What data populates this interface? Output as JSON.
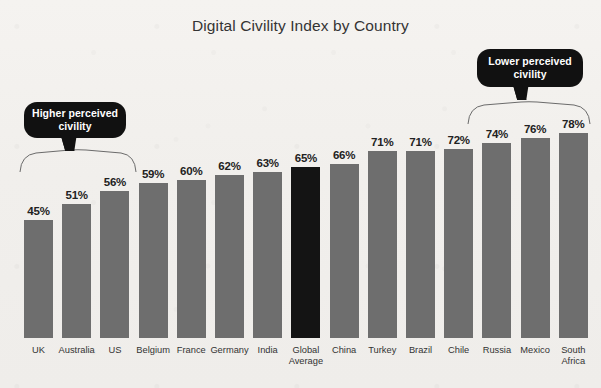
{
  "chart_data": {
    "type": "bar",
    "title": "Digital Civility Index by Country",
    "xlabel": "",
    "ylabel": "",
    "ylim": [
      0,
      80
    ],
    "grid": false,
    "legend": "none",
    "categories": [
      "UK",
      "Australia",
      "US",
      "Belgium",
      "France",
      "Germany",
      "India",
      "Global\nAverage",
      "China",
      "Turkey",
      "Brazil",
      "Chile",
      "Russia",
      "Mexico",
      "South\nAfrica"
    ],
    "values": [
      45,
      51,
      56,
      59,
      60,
      62,
      63,
      65,
      66,
      71,
      71,
      72,
      74,
      76,
      78
    ],
    "value_labels": [
      "45%",
      "51%",
      "56%",
      "59%",
      "60%",
      "62%",
      "63%",
      "65%",
      "66%",
      "71%",
      "71%",
      "72%",
      "74%",
      "76%",
      "78%"
    ],
    "bar_colors": [
      "#6e6e6e",
      "#6e6e6e",
      "#6e6e6e",
      "#6e6e6e",
      "#6e6e6e",
      "#6e6e6e",
      "#6e6e6e",
      "#141414",
      "#6e6e6e",
      "#6e6e6e",
      "#6e6e6e",
      "#6e6e6e",
      "#6e6e6e",
      "#6e6e6e",
      "#6e6e6e"
    ],
    "highlight_index": 7,
    "annotations": [
      {
        "id": "higher",
        "text": "Higher perceived civility",
        "line1": "Higher perceived",
        "line2": "civility",
        "spans_categories": [
          "UK",
          "Australia",
          "US"
        ]
      },
      {
        "id": "lower",
        "text": "Lower perceived civility",
        "line1": "Lower perceived",
        "line2": "civility",
        "spans_categories": [
          "Russia",
          "Mexico",
          "South Africa"
        ]
      }
    ]
  },
  "colors": {
    "background": "#f2f0ed",
    "bar_default": "#6e6e6e",
    "bar_highlight": "#141414",
    "callout_background": "#111111",
    "callout_text": "#ffffff",
    "title_text": "#343434",
    "bracket_stroke": "#6b6b6b"
  }
}
